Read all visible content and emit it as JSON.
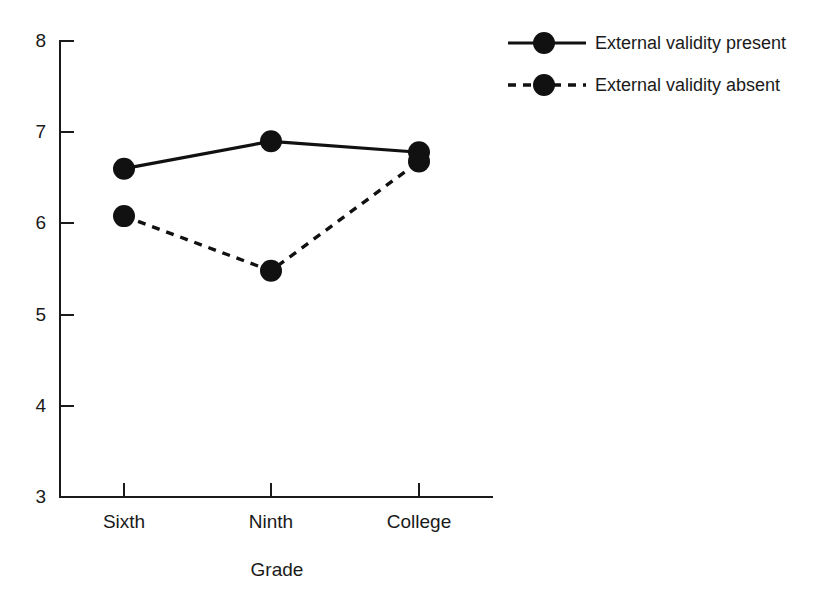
{
  "chart_data": {
    "type": "line",
    "title": "",
    "xlabel": "Grade",
    "ylabel": "",
    "categories": [
      "Sixth",
      "Ninth",
      "College"
    ],
    "series": [
      {
        "name": "External validity present",
        "style": "solid",
        "marker": "filled-circle",
        "values": [
          6.6,
          6.9,
          6.78
        ]
      },
      {
        "name": "External validity absent",
        "style": "dashed",
        "marker": "filled-circle",
        "values": [
          6.08,
          5.48,
          6.68
        ]
      }
    ],
    "ylim": [
      3,
      8
    ],
    "yticks": [
      3,
      4,
      5,
      6,
      7,
      8
    ],
    "ytick_labels": [
      "3",
      "4",
      "5",
      "6",
      "7",
      "8"
    ],
    "grid": false,
    "legend_position": "top-right",
    "line_color": "#111111"
  },
  "axes": {
    "y_tick_labels": [
      "8",
      "7",
      "6",
      "5",
      "4",
      "3"
    ],
    "x_category_labels": [
      "Sixth",
      "Ninth",
      "College"
    ],
    "x_axis_title": "Grade"
  },
  "legend": {
    "entries": [
      {
        "label": "External validity present",
        "style": "solid"
      },
      {
        "label": "External validity absent",
        "style": "dashed"
      }
    ]
  }
}
